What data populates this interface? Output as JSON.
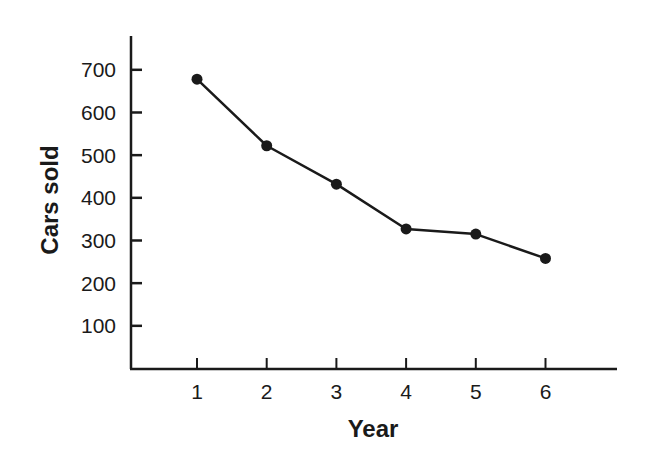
{
  "chart_data": {
    "type": "line",
    "title": "",
    "xlabel": "Year",
    "ylabel": "Cars sold",
    "categories": [
      "1",
      "2",
      "3",
      "4",
      "5",
      "6"
    ],
    "x": [
      1,
      2,
      3,
      4,
      5,
      6
    ],
    "values": [
      678,
      522,
      432,
      327,
      315,
      258
    ],
    "series": [
      {
        "name": "Cars sold",
        "values": [
          678,
          522,
          432,
          327,
          315,
          258
        ]
      }
    ],
    "x_ticks": [
      "1",
      "2",
      "3",
      "4",
      "5",
      "6"
    ],
    "y_ticks": [
      "100",
      "200",
      "300",
      "400",
      "500",
      "600",
      "700"
    ],
    "ylim": [
      0,
      780
    ],
    "xlim": [
      0,
      7.2
    ],
    "grid": false,
    "legend": "none",
    "markers": "filled-circle",
    "line_color": "#1a1a1a"
  }
}
